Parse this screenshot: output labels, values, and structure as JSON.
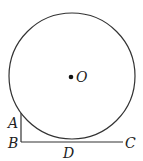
{
  "figure": {
    "circle": {
      "cx": 72,
      "cy": 76,
      "r": 63,
      "stroke": "#333333"
    },
    "center_label": "O",
    "points": {
      "A": {
        "label": "A",
        "x": 21,
        "y": 113
      },
      "B": {
        "label": "B",
        "x": 21,
        "y": 142
      },
      "C": {
        "label": "C",
        "x": 124,
        "y": 142
      },
      "D": {
        "label": "D",
        "x": 72,
        "y": 142
      }
    },
    "segments": [
      "AB",
      "BC"
    ]
  }
}
